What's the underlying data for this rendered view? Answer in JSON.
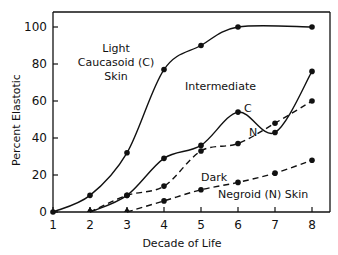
{
  "chart_data": {
    "type": "line",
    "title": "",
    "xlabel": "Decade of Life",
    "ylabel": "Percent Elastotic",
    "x": [
      1,
      2,
      3,
      4,
      5,
      6,
      7,
      8
    ],
    "xlim": [
      1,
      8
    ],
    "ylim": [
      0,
      100
    ],
    "x_ticks": [
      "1",
      "2",
      "3",
      "4",
      "5",
      "6",
      "7",
      "8"
    ],
    "y_ticks": [
      "0",
      "20",
      "40",
      "60",
      "80",
      "100"
    ],
    "grid": false,
    "legend": "none (inline annotations)",
    "series": [
      {
        "name": "Light Caucasoid (C) Skin",
        "style": "solid",
        "x": [
          1,
          2,
          3,
          4,
          5,
          6,
          8
        ],
        "values": [
          0,
          9,
          32,
          77,
          90,
          100,
          100
        ]
      },
      {
        "name": "Intermediate C",
        "style": "solid",
        "x": [
          2,
          3,
          4,
          5,
          6,
          7,
          8
        ],
        "values": [
          0,
          9,
          29,
          36,
          54,
          43,
          76
        ]
      },
      {
        "name": "Intermediate N",
        "style": "dashed",
        "x": [
          2,
          3,
          4,
          5,
          6,
          7,
          8
        ],
        "values": [
          0,
          9,
          14,
          33,
          37,
          48,
          60
        ]
      },
      {
        "name": "Dark Negroid (N) Skin",
        "style": "dashed",
        "x": [
          3,
          4,
          5,
          6,
          7,
          8
        ],
        "values": [
          0,
          6,
          12,
          16,
          21,
          28
        ]
      }
    ],
    "annotations": [
      "Light",
      "Caucasoid (C)",
      "Skin",
      "Intermediate",
      "C",
      "N",
      "Dark",
      "Negroid (N)  Skin"
    ]
  },
  "labels": {
    "y_axis": "Percent Elastotic",
    "x_axis": "Decade of Life",
    "light_line1": "Light",
    "light_line2": "Caucasoid (C)",
    "light_line3": "Skin",
    "intermediate": "Intermediate",
    "c_marker": "C",
    "n_marker": "N",
    "dark": "Dark",
    "negroid": "Negroid (N)  Skin"
  }
}
